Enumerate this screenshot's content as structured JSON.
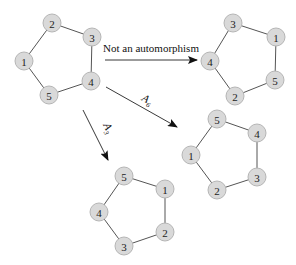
{
  "diagram": {
    "node_fill": "#d9d9d9",
    "graphs": [
      {
        "id": "original",
        "nodes": [
          {
            "label": "1",
            "x": 24,
            "y": 61
          },
          {
            "label": "2",
            "x": 52,
            "y": 23
          },
          {
            "label": "3",
            "x": 92,
            "y": 37
          },
          {
            "label": "4",
            "x": 91,
            "y": 81
          },
          {
            "label": "5",
            "x": 49,
            "y": 95
          }
        ],
        "edges": [
          [
            "1",
            "2"
          ],
          [
            "2",
            "3"
          ],
          [
            "3",
            "4"
          ],
          [
            "4",
            "5"
          ],
          [
            "5",
            "1"
          ]
        ]
      },
      {
        "id": "not-automorphism",
        "nodes": [
          {
            "label": "3",
            "x": 233,
            "y": 23
          },
          {
            "label": "1",
            "x": 276,
            "y": 37
          },
          {
            "label": "5",
            "x": 275,
            "y": 80
          },
          {
            "label": "2",
            "x": 235,
            "y": 96
          },
          {
            "label": "4",
            "x": 210,
            "y": 61
          }
        ],
        "edges": [
          [
            "3",
            "1"
          ],
          [
            "1",
            "5"
          ],
          [
            "5",
            "2"
          ],
          [
            "2",
            "4"
          ],
          [
            "4",
            "3"
          ]
        ]
      },
      {
        "id": "A6-result",
        "nodes": [
          {
            "label": "5",
            "x": 217,
            "y": 119
          },
          {
            "label": "4",
            "x": 257,
            "y": 133
          },
          {
            "label": "3",
            "x": 257,
            "y": 177
          },
          {
            "label": "2",
            "x": 217,
            "y": 190
          },
          {
            "label": "1",
            "x": 191,
            "y": 155
          }
        ],
        "edges": [
          [
            "5",
            "4"
          ],
          [
            "4",
            "3"
          ],
          [
            "3",
            "2"
          ],
          [
            "2",
            "1"
          ],
          [
            "1",
            "5"
          ]
        ]
      },
      {
        "id": "A3-result",
        "nodes": [
          {
            "label": "5",
            "x": 124,
            "y": 176
          },
          {
            "label": "1",
            "x": 165,
            "y": 189
          },
          {
            "label": "2",
            "x": 165,
            "y": 232
          },
          {
            "label": "3",
            "x": 124,
            "y": 246
          },
          {
            "label": "4",
            "x": 99,
            "y": 212
          }
        ],
        "edges": [
          [
            "5",
            "1"
          ],
          [
            "1",
            "2"
          ],
          [
            "2",
            "3"
          ],
          [
            "3",
            "4"
          ],
          [
            "4",
            "5"
          ]
        ]
      }
    ],
    "arrows": [
      {
        "name": "not-automorphism-arrow",
        "x1": 105,
        "y1": 60,
        "x2": 197,
        "y2": 60,
        "label": "Not an automorphism",
        "lx": 103,
        "ly": 52,
        "rotate": 0,
        "italic": false
      },
      {
        "name": "a6-arrow",
        "x1": 106,
        "y1": 87,
        "x2": 177,
        "y2": 127,
        "label": "A6",
        "lx": 141,
        "ly": 100,
        "rotate": 29,
        "italic": true
      },
      {
        "name": "a3-arrow",
        "x1": 83,
        "y1": 110,
        "x2": 108,
        "y2": 160,
        "label": "A3",
        "lx": 103,
        "ly": 125,
        "rotate": 63,
        "italic": true
      }
    ]
  }
}
